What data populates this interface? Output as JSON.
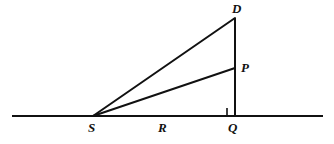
{
  "figure": {
    "type": "geometry-diagram",
    "width": 334,
    "height": 144,
    "background_color": "#ffffff",
    "stroke_color": "#111111",
    "stroke_width": 2,
    "points": {
      "S": {
        "label": "S",
        "x": 93,
        "y": 116
      },
      "Q": {
        "label": "Q",
        "x": 235,
        "y": 116
      },
      "D": {
        "label": "D",
        "x": 235,
        "y": 18
      },
      "P": {
        "label": "P",
        "x": 235,
        "y": 68
      }
    },
    "segment_labels": {
      "R": {
        "label": "R",
        "x": 163,
        "y": 127,
        "describes": "length of segment SQ along the ground line"
      }
    },
    "lines": {
      "ground_line": {
        "name": "ground-line",
        "x1": 12,
        "y1": 116,
        "x2": 323,
        "y2": 116
      },
      "vertical_DQ": {
        "name": "segment-DQ",
        "x1": 235,
        "y1": 18,
        "x2": 235,
        "y2": 116
      },
      "ray_SD": {
        "name": "segment-SD",
        "x1": 93,
        "y1": 116,
        "x2": 235,
        "y2": 18
      },
      "ray_SP": {
        "name": "segment-SP",
        "x1": 93,
        "y1": 116,
        "x2": 235,
        "y2": 68
      }
    },
    "right_angle_marker": {
      "name": "right-angle-marker-Q",
      "at_point": "Q",
      "size": 8,
      "x": 227,
      "y": 108
    }
  }
}
